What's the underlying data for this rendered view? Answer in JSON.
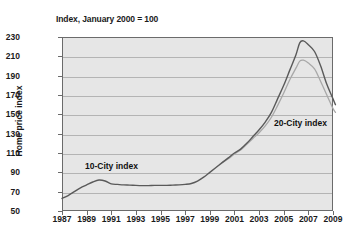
{
  "chart_data": {
    "type": "line",
    "title": "",
    "subtitle": "Index, January 2000 = 100",
    "xlabel": "",
    "ylabel": "Home price index",
    "xlim": [
      1987,
      2009
    ],
    "ylim": [
      50,
      230
    ],
    "ytick_step": 20,
    "xtick_step": 2,
    "grid": true,
    "legend_position": "inline-annotations",
    "yticks": [
      230,
      210,
      190,
      170,
      150,
      130,
      110,
      90,
      70,
      50
    ],
    "xticks": [
      1987,
      1989,
      1991,
      1993,
      1995,
      1997,
      1999,
      2001,
      2003,
      2005,
      2007,
      2009
    ],
    "annotations": [
      {
        "id": "annot-10",
        "text": "10-City index",
        "x": 1991.2,
        "y": 103
      },
      {
        "id": "annot-20",
        "text": "20-City index",
        "x": 2005.9,
        "y": 140
      }
    ],
    "colors": {
      "series_10_city": "#5a5a5a",
      "series_20_city": "#a8a8a8",
      "plot_background": "#e6e6e6",
      "gridline": "#b4b4b4",
      "axis": "#6b6b6b",
      "text": "#1a1a1a"
    },
    "series": [
      {
        "name": "10-City index",
        "color": "#5a5a5a",
        "x": [
          1987.0,
          1987.5,
          1988.0,
          1988.5,
          1989.0,
          1989.5,
          1990.0,
          1990.5,
          1991.0,
          1991.5,
          1992.0,
          1992.5,
          1993.0,
          1993.5,
          1994.0,
          1994.5,
          1995.0,
          1995.5,
          1996.0,
          1996.5,
          1997.0,
          1997.5,
          1998.0,
          1998.5,
          1999.0,
          1999.5,
          2000.0,
          2000.5,
          2001.0,
          2001.5,
          2002.0,
          2002.5,
          2003.0,
          2003.5,
          2004.0,
          2004.5,
          2005.0,
          2005.5,
          2006.0,
          2006.3,
          2006.6,
          2007.0,
          2007.5,
          2008.0,
          2008.5,
          2009.0,
          2009.2
        ],
        "y": [
          63,
          66,
          70,
          74,
          77,
          80,
          82,
          81,
          78,
          77.5,
          77,
          76.8,
          76.5,
          76.3,
          76.3,
          76.5,
          76.5,
          76.5,
          76.8,
          77,
          77.5,
          78.5,
          81,
          85,
          90,
          95,
          100,
          105,
          110,
          114,
          120,
          127,
          134,
          142,
          152,
          166,
          180,
          196,
          212,
          224,
          226,
          222,
          215,
          200,
          181,
          166,
          160
        ]
      },
      {
        "name": "20-City index",
        "color": "#a8a8a8",
        "x": [
          2000.0,
          2000.5,
          2001.0,
          2001.5,
          2002.0,
          2002.5,
          2003.0,
          2003.5,
          2004.0,
          2004.5,
          2005.0,
          2005.5,
          2006.0,
          2006.3,
          2006.6,
          2007.0,
          2007.5,
          2008.0,
          2008.5,
          2009.0,
          2009.2
        ],
        "y": [
          100,
          104,
          109,
          113,
          119,
          125,
          131,
          138,
          147,
          159,
          172,
          186,
          198,
          205,
          206,
          203,
          197,
          184,
          170,
          156,
          152
        ]
      }
    ]
  }
}
